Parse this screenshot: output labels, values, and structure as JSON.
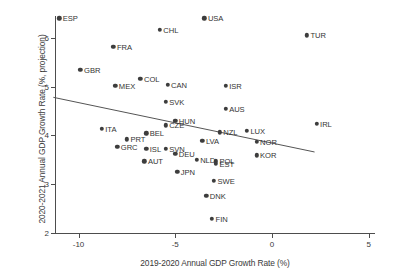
{
  "chart_data": {
    "type": "scatter",
    "title": "",
    "xlabel": "2019-2020 Annual GDP Growth Rate (%)",
    "ylabel": "2020-2021 Annual GDP Growth Rate (%, projection)",
    "xlim": [
      -11.6,
      5.4
    ],
    "ylim": [
      1.85,
      6.6
    ],
    "xticks": [
      -10,
      -5,
      0,
      5
    ],
    "xticklabels": [
      "-10",
      "-5",
      "0",
      "5"
    ],
    "yticks": [
      2,
      3,
      4,
      5,
      6
    ],
    "yticklabels": [
      "2",
      "3",
      "4",
      "5",
      "6"
    ],
    "grid": false,
    "legend": null,
    "point_color": "#3d3d3d",
    "line_color": "#555555",
    "fit_line": {
      "type": "linear-trend",
      "x_start": -11.3,
      "y_start": 4.78,
      "x_end": 2.2,
      "y_end": 3.66
    },
    "points": [
      {
        "label": "ESP",
        "x": -11.0,
        "y": 6.4,
        "label_side": "right"
      },
      {
        "label": "USA",
        "x": -3.5,
        "y": 6.4,
        "label_side": "right"
      },
      {
        "label": "CHL",
        "x": -5.8,
        "y": 6.16,
        "label_side": "right"
      },
      {
        "label": "TUR",
        "x": 1.8,
        "y": 6.05,
        "label_side": "right"
      },
      {
        "label": "FRA",
        "x": -8.2,
        "y": 5.82,
        "label_side": "right"
      },
      {
        "label": "GBR",
        "x": -9.9,
        "y": 5.35,
        "label_side": "right"
      },
      {
        "label": "COL",
        "x": -6.8,
        "y": 5.16,
        "label_side": "right"
      },
      {
        "label": "MEX",
        "x": -8.1,
        "y": 5.02,
        "label_side": "right"
      },
      {
        "label": "CAN",
        "x": -5.4,
        "y": 5.04,
        "label_side": "right"
      },
      {
        "label": "ISR",
        "x": -2.4,
        "y": 5.02,
        "label_side": "right"
      },
      {
        "label": "SVK",
        "x": -5.5,
        "y": 4.69,
        "label_side": "right"
      },
      {
        "label": "AUS",
        "x": -2.4,
        "y": 4.54,
        "label_side": "right"
      },
      {
        "label": "IRL",
        "x": 2.3,
        "y": 4.24,
        "label_side": "right"
      },
      {
        "label": "HUN",
        "x": -5.0,
        "y": 4.3,
        "label_side": "right"
      },
      {
        "label": "CZE",
        "x": -5.5,
        "y": 4.21,
        "label_side": "right"
      },
      {
        "label": "ITA",
        "x": -8.8,
        "y": 4.14,
        "label_side": "right"
      },
      {
        "label": "LUX",
        "x": -1.3,
        "y": 4.1,
        "label_side": "right"
      },
      {
        "label": "NZL",
        "x": -2.7,
        "y": 4.06,
        "label_side": "right"
      },
      {
        "label": "BEL",
        "x": -6.5,
        "y": 4.04,
        "label_side": "right"
      },
      {
        "label": "PRT",
        "x": -7.5,
        "y": 3.92,
        "label_side": "right"
      },
      {
        "label": "LVA",
        "x": -3.6,
        "y": 3.89,
        "label_side": "right"
      },
      {
        "label": "NOR",
        "x": -0.8,
        "y": 3.87,
        "label_side": "right"
      },
      {
        "label": "GRC",
        "x": -8.0,
        "y": 3.77,
        "label_side": "right"
      },
      {
        "label": "ISL",
        "x": -6.5,
        "y": 3.72,
        "label_side": "right"
      },
      {
        "label": "SVN",
        "x": -5.5,
        "y": 3.72,
        "label_side": "right"
      },
      {
        "label": "DEU",
        "x": -5.0,
        "y": 3.62,
        "label_side": "right"
      },
      {
        "label": "KOR",
        "x": -0.8,
        "y": 3.59,
        "label_side": "right"
      },
      {
        "label": "NLD",
        "x": -3.9,
        "y": 3.5,
        "label_side": "right"
      },
      {
        "label": "POL",
        "x": -2.9,
        "y": 3.47,
        "label_side": "right"
      },
      {
        "label": "EST",
        "x": -2.9,
        "y": 3.42,
        "label_side": "right"
      },
      {
        "label": "AUT",
        "x": -6.6,
        "y": 3.47,
        "label_side": "right"
      },
      {
        "label": "JPN",
        "x": -4.9,
        "y": 3.25,
        "label_side": "right"
      },
      {
        "label": "SWE",
        "x": -3.0,
        "y": 3.07,
        "label_side": "right"
      },
      {
        "label": "DNK",
        "x": -3.4,
        "y": 2.76,
        "label_side": "right"
      },
      {
        "label": "FIN",
        "x": -3.1,
        "y": 2.29,
        "label_side": "right"
      }
    ]
  }
}
